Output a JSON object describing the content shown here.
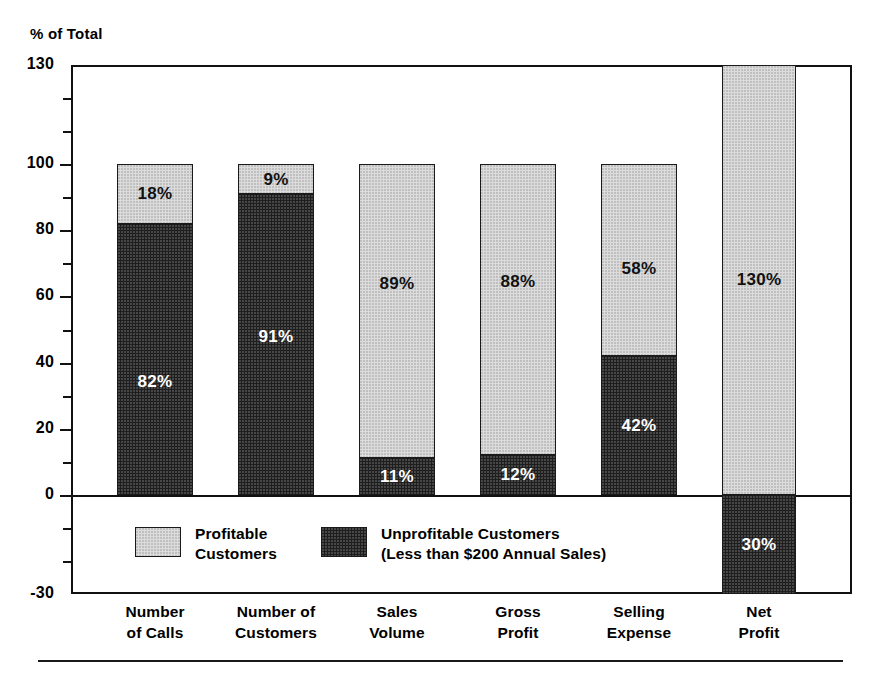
{
  "chart_data": {
    "type": "bar",
    "subtype": "stacked-bar-with-negative",
    "title": "",
    "ylabel": "% of Total",
    "xlabel": "",
    "ylim": [
      -30,
      130
    ],
    "grid": false,
    "legend_position": "inside-bottom-left",
    "y_ticks_major": [
      130,
      100,
      80,
      60,
      40,
      20,
      0,
      -30
    ],
    "y_tick_labels": [
      "130",
      "100",
      "80",
      "60",
      "40",
      "20",
      "0",
      "-30"
    ],
    "y_ticks_minor": [
      120,
      110,
      90,
      70,
      50,
      30,
      10,
      -10,
      -20
    ],
    "categories": [
      "Number of Calls",
      "Number of Customers",
      "Sales Volume",
      "Gross Profit",
      "Selling Expense",
      "Net Profit"
    ],
    "series": [
      {
        "name": "Profitable Customers",
        "color": "#dcdcdc",
        "values": [
          18,
          9,
          89,
          88,
          58,
          130
        ],
        "labels": [
          "18%",
          "9%",
          "89%",
          "88%",
          "58%",
          "130%"
        ]
      },
      {
        "name": "Unprofitable Customers (Less than $200 Annual Sales)",
        "color": "#1e1e1e",
        "values": [
          82,
          91,
          11,
          12,
          42,
          -30
        ],
        "labels": [
          "82%",
          "91%",
          "11%",
          "12%",
          "42%",
          "30%"
        ]
      }
    ]
  },
  "axis": {
    "y_title": "% of Total"
  },
  "categories": [
    {
      "line1": "Number",
      "line2": "of Calls"
    },
    {
      "line1": "Number of",
      "line2": "Customers"
    },
    {
      "line1": "Sales",
      "line2": "Volume"
    },
    {
      "line1": "Gross",
      "line2": "Profit"
    },
    {
      "line1": "Selling",
      "line2": "Expense"
    },
    {
      "line1": "Net",
      "line2": "Profit"
    }
  ],
  "bars": [
    {
      "category": "Number of Calls",
      "light_label": "18%",
      "dark_label": "82%",
      "light_value": 18,
      "dark_value": 82
    },
    {
      "category": "Number of Customers",
      "light_label": "9%",
      "dark_label": "91%",
      "light_value": 9,
      "dark_value": 91
    },
    {
      "category": "Sales Volume",
      "light_label": "89%",
      "dark_label": "11%",
      "light_value": 89,
      "dark_value": 11
    },
    {
      "category": "Gross Profit",
      "light_label": "88%",
      "dark_label": "12%",
      "light_value": 88,
      "dark_value": 12
    },
    {
      "category": "Selling Expense",
      "light_label": "58%",
      "dark_label": "42%",
      "light_value": 58,
      "dark_value": 42
    },
    {
      "category": "Net Profit",
      "light_label": "130%",
      "dark_label": "30%",
      "light_value": 130,
      "dark_value": -30
    }
  ],
  "y_axis_labels": [
    "130",
    "100",
    "80",
    "60",
    "40",
    "20",
    "0",
    "-30"
  ],
  "legend": {
    "entries": [
      {
        "swatch": "light",
        "line1": "Profitable",
        "line2": "Customers"
      },
      {
        "swatch": "dark",
        "line1": "Unprofitable Customers",
        "line2": "(Less than $200 Annual Sales)"
      }
    ]
  },
  "colors": {
    "profitable": "#dcdcdc",
    "unprofitable": "#1e1e1e",
    "axis": "#111111",
    "background": "#ffffff"
  }
}
